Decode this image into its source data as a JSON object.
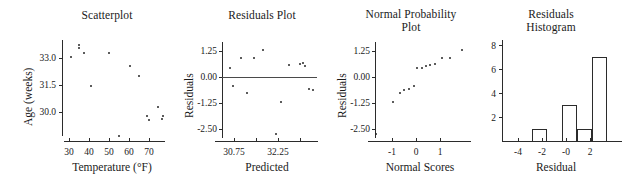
{
  "figure": {
    "caption_absent": true
  },
  "chart_data": [
    {
      "type": "scatter",
      "panel_index": 1,
      "title": "Scatterplot",
      "xlabel": "Temperature (°F)",
      "ylabel": "Age (weeks)",
      "xlim": [
        26,
        74
      ],
      "ylim": [
        28.6,
        33.9
      ],
      "xticks": [
        30,
        40,
        50,
        60,
        70
      ],
      "xtick_labels": [
        "30",
        "40",
        "50",
        "60",
        "70"
      ],
      "yticks": [
        33.0,
        31.5,
        30.0
      ],
      "ytick_labels": [
        "33.0",
        "31.5",
        "30.0"
      ],
      "grid": false,
      "legend": "none",
      "n": 14,
      "x": [
        29.5,
        33.0,
        33.0,
        35.5,
        39.0,
        47.5,
        52.0,
        57.5,
        61.5,
        65.5,
        66.5,
        70.5,
        72.5,
        73.0
      ],
      "y": [
        33.0,
        33.65,
        33.5,
        33.2,
        31.5,
        33.2,
        28.85,
        32.55,
        32.0,
        29.9,
        29.7,
        30.4,
        29.75,
        29.9
      ]
    },
    {
      "type": "scatter",
      "panel_index": 2,
      "title": "Residuals Plot",
      "xlabel": "Predicted",
      "ylabel": "Residuals",
      "xlim": [
        29.9,
        33.6
      ],
      "ylim": [
        -3.2,
        1.85
      ],
      "xticks": [
        30.75,
        31.5,
        32.25,
        33.0
      ],
      "xtick_labels": [
        "30.75",
        "",
        "32.25",
        ""
      ],
      "yticks": [
        1.25,
        0.0,
        -1.25,
        -2.5
      ],
      "ytick_labels": [
        "1.25",
        "0.00",
        "-1.25",
        "-2.50"
      ],
      "reference_line_y": 0.0,
      "grid": false,
      "legend": "none",
      "n": 14,
      "x": [
        30.15,
        30.25,
        30.55,
        30.8,
        31.1,
        31.45,
        31.95,
        32.15,
        32.45,
        32.9,
        33.0,
        33.1,
        33.25,
        33.4
      ],
      "y": [
        0.5,
        -0.4,
        1.05,
        -0.75,
        1.05,
        1.45,
        -2.85,
        -1.2,
        0.7,
        0.75,
        0.8,
        0.65,
        -0.55,
        -0.6
      ]
    },
    {
      "type": "scatter",
      "panel_index": 3,
      "title": "Normal Probability Plot",
      "title_lines": [
        "Normal Probability",
        "Plot"
      ],
      "xlabel": "Normal Scores",
      "ylabel": "Residuals",
      "xlim": [
        -1.95,
        1.95
      ],
      "ylim": [
        -3.2,
        1.85
      ],
      "xticks": [
        -1,
        0,
        1
      ],
      "xtick_labels": [
        "-1",
        "0",
        "1"
      ],
      "yticks": [
        1.25,
        0.0,
        -1.25,
        -2.5
      ],
      "ytick_labels": [
        "1.25",
        "0.00",
        "-1.25",
        "-2.50"
      ],
      "grid": false,
      "legend": "none",
      "n": 14,
      "x": [
        -1.72,
        -1.06,
        -0.79,
        -0.62,
        -0.45,
        -0.27,
        -0.12,
        0.04,
        0.2,
        0.37,
        0.57,
        0.82,
        1.12,
        1.6
      ],
      "y": [
        -2.85,
        -1.2,
        -0.75,
        -0.6,
        -0.55,
        -0.4,
        0.5,
        0.5,
        0.65,
        0.7,
        0.75,
        1.05,
        1.05,
        1.45
      ]
    },
    {
      "type": "bar",
      "subtype": "histogram",
      "panel_index": 4,
      "title": "Residuals Histogram",
      "title_lines": [
        "Residuals",
        "Histogram"
      ],
      "xlabel": "Residual",
      "ylabel": "",
      "xlim": [
        -5,
        3
      ],
      "ylim": [
        0,
        8.4
      ],
      "xticks": [
        -4,
        -2,
        0,
        2
      ],
      "xtick_labels": [
        "-4",
        "-2",
        "-0",
        "2"
      ],
      "yticks": [
        8,
        6,
        4,
        2
      ],
      "ytick_labels": [
        "8",
        "6",
        "4",
        "2"
      ],
      "grid": false,
      "legend": "none",
      "bin_width": 1,
      "bin_edges": [
        -3,
        -2,
        -1,
        0,
        1,
        2
      ],
      "categories": [
        "-3 to -2",
        "-2 to -1",
        "-1 to 0",
        "0 to 1",
        "1 to 2"
      ],
      "values": [
        1,
        0,
        3,
        1,
        7
      ]
    }
  ]
}
